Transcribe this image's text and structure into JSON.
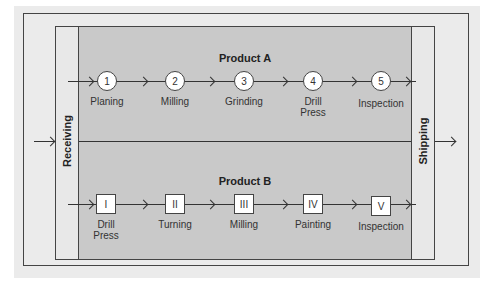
{
  "diagram": {
    "receiving_label": "Receiving",
    "shipping_label": "Shipping",
    "product_a": {
      "title": "Product A",
      "steps": [
        {
          "id": "1",
          "label": "Planing"
        },
        {
          "id": "2",
          "label": "Milling"
        },
        {
          "id": "3",
          "label": "Grinding"
        },
        {
          "id": "4",
          "label": "Drill\nPress"
        },
        {
          "id": "5",
          "label": "Inspection"
        }
      ]
    },
    "product_b": {
      "title": "Product B",
      "steps": [
        {
          "id": "I",
          "label": "Drill\nPress"
        },
        {
          "id": "II",
          "label": "Turning"
        },
        {
          "id": "III",
          "label": "Milling"
        },
        {
          "id": "IV",
          "label": "Painting"
        },
        {
          "id": "V",
          "label": "Inspection"
        }
      ]
    },
    "colors": {
      "panel_bg": "#ebebeb",
      "work_area": "#c9c9c9",
      "node_fill": "#ffffff",
      "line": "#333333"
    }
  }
}
